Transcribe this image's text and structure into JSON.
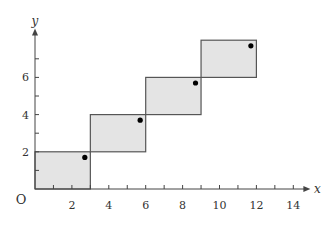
{
  "chart_data": {
    "type": "bar",
    "title": "",
    "xlabel": "x",
    "ylabel": "y",
    "origin_label": "O",
    "xlim": [
      0,
      14.5
    ],
    "ylim": [
      0,
      8.3
    ],
    "x_ticks": [
      2,
      4,
      6,
      8,
      10,
      12,
      14
    ],
    "y_ticks": [
      2,
      4,
      6
    ],
    "grid": false,
    "legend": null,
    "bars": [
      {
        "x_start": 0,
        "x_end": 3,
        "y_bottom": 0,
        "y_top": 2
      },
      {
        "x_start": 3,
        "x_end": 6,
        "y_bottom": 2,
        "y_top": 4
      },
      {
        "x_start": 6,
        "x_end": 9,
        "y_bottom": 4,
        "y_top": 6
      },
      {
        "x_start": 9,
        "x_end": 12,
        "y_bottom": 6,
        "y_top": 8
      }
    ],
    "points": [
      {
        "x": 2.7,
        "y": 1.7
      },
      {
        "x": 5.7,
        "y": 3.7
      },
      {
        "x": 8.7,
        "y": 5.7
      },
      {
        "x": 11.7,
        "y": 7.7
      }
    ],
    "colors": {
      "fill": "#e4e4e4",
      "stroke": "#555555",
      "axis": "#444444",
      "point": "#000000"
    }
  }
}
